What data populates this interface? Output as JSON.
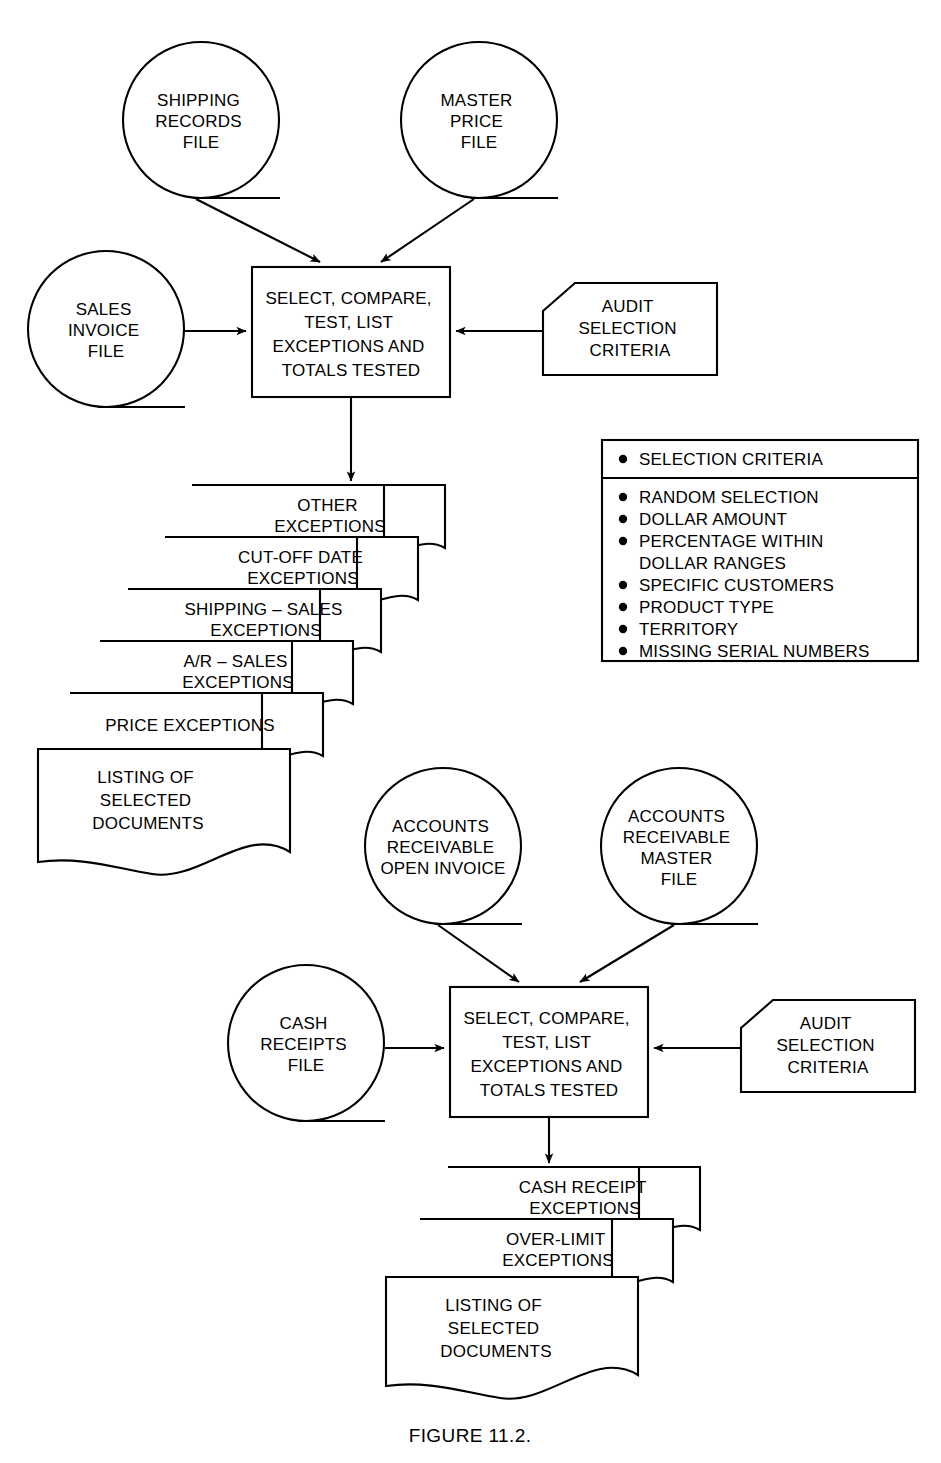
{
  "figure": {
    "caption": "FIGURE 11.2."
  },
  "colors": {
    "stroke": "#000000",
    "background": "#ffffff"
  },
  "sales_section": {
    "inputs": [
      {
        "id": "shipping-records-file",
        "shape": "magnetic-tape",
        "lines": [
          "SHIPPING",
          "RECORDS",
          "FILE"
        ]
      },
      {
        "id": "master-price-file",
        "shape": "magnetic-tape",
        "lines": [
          "MASTER",
          "PRICE",
          "FILE"
        ]
      },
      {
        "id": "sales-invoice-file",
        "shape": "magnetic-tape",
        "lines": [
          "SALES",
          "INVOICE",
          "FILE"
        ]
      }
    ],
    "process": {
      "id": "sales-process",
      "shape": "process",
      "lines": [
        "SELECT, COMPARE,",
        "TEST, LIST",
        "EXCEPTIONS AND",
        "TOTALS TESTED"
      ]
    },
    "manual_input": {
      "id": "audit-selection-criteria-sales",
      "shape": "manual-input",
      "lines": [
        "AUDIT",
        "SELECTION",
        "CRITERIA"
      ]
    },
    "outputs": [
      {
        "id": "other-exceptions",
        "lines": [
          "OTHER",
          "EXCEPTIONS"
        ]
      },
      {
        "id": "cut-off-date-exceptions",
        "lines": [
          "CUT-OFF DATE",
          "EXCEPTIONS"
        ]
      },
      {
        "id": "shipping-sales-exceptions",
        "lines": [
          "SHIPPING – SALES",
          "EXCEPTIONS"
        ]
      },
      {
        "id": "ar-sales-exceptions",
        "lines": [
          "A/R – SALES",
          "EXCEPTIONS"
        ]
      },
      {
        "id": "price-exceptions",
        "lines": [
          "PRICE EXCEPTIONS"
        ]
      },
      {
        "id": "listing-of-selected-documents-sales",
        "lines": [
          "LISTING OF",
          "SELECTED",
          "DOCUMENTS"
        ]
      }
    ]
  },
  "criteria_panel": {
    "id": "selection-criteria-panel",
    "header": "SELECTION CRITERIA",
    "items": [
      "RANDOM SELECTION",
      "DOLLAR AMOUNT",
      "PERCENTAGE WITHIN",
      "DOLLAR RANGES",
      "SPECIFIC CUSTOMERS",
      "PRODUCT TYPE",
      "TERRITORY",
      "MISSING SERIAL NUMBERS"
    ],
    "bulleted": [
      true,
      true,
      true,
      false,
      true,
      true,
      true,
      true
    ]
  },
  "cash_section": {
    "inputs": [
      {
        "id": "ar-open-invoice-file",
        "shape": "magnetic-tape",
        "lines": [
          "ACCOUNTS",
          "RECEIVABLE",
          "OPEN INVOICE"
        ]
      },
      {
        "id": "ar-master-file",
        "shape": "magnetic-tape",
        "lines": [
          "ACCOUNTS",
          "RECEIVABLE",
          "MASTER",
          "FILE"
        ]
      },
      {
        "id": "cash-receipts-file",
        "shape": "magnetic-tape",
        "lines": [
          "CASH",
          "RECEIPTS",
          "FILE"
        ]
      }
    ],
    "process": {
      "id": "cash-process",
      "shape": "process",
      "lines": [
        "SELECT, COMPARE,",
        "TEST, LIST",
        "EXCEPTIONS AND",
        "TOTALS TESTED"
      ]
    },
    "manual_input": {
      "id": "audit-selection-criteria-cash",
      "shape": "manual-input",
      "lines": [
        "AUDIT",
        "SELECTION",
        "CRITERIA"
      ]
    },
    "outputs": [
      {
        "id": "cash-receipt-exceptions",
        "lines": [
          "CASH RECEIPT",
          "EXCEPTIONS"
        ]
      },
      {
        "id": "over-limit-exceptions",
        "lines": [
          "OVER-LIMIT",
          "EXCEPTIONS"
        ]
      },
      {
        "id": "listing-of-selected-documents-cash",
        "lines": [
          "LISTING OF",
          "SELECTED",
          "DOCUMENTS"
        ]
      }
    ]
  }
}
